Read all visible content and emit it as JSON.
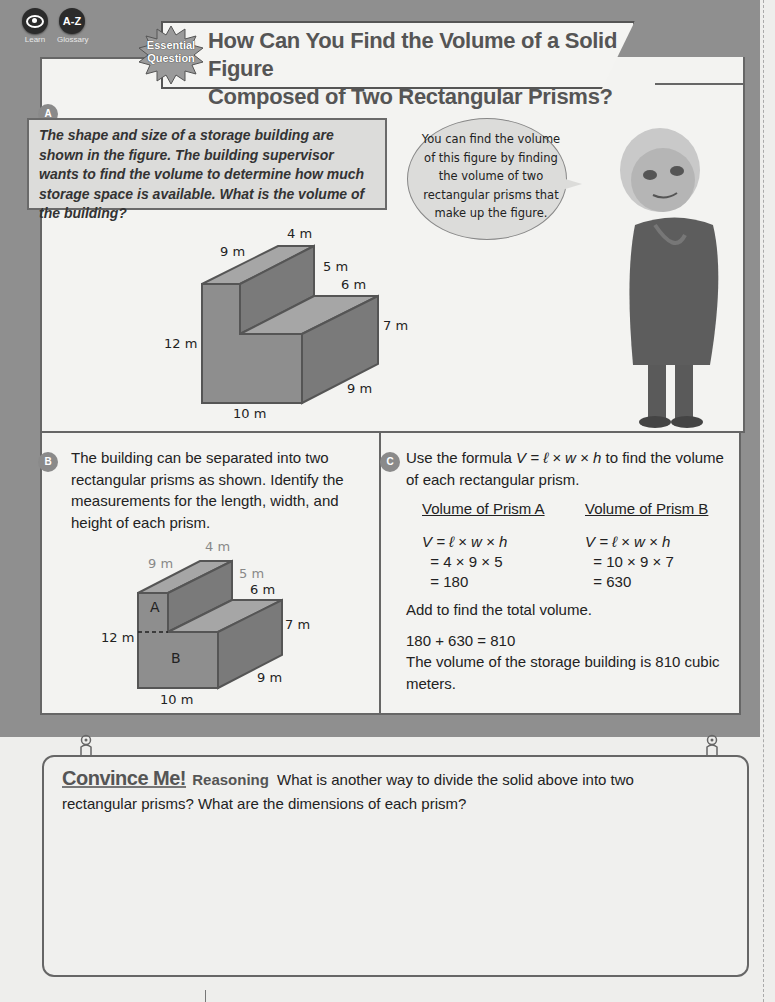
{
  "header": {
    "icons": [
      {
        "name": "learn",
        "label": "Learn",
        "icon": "eye-icon"
      },
      {
        "name": "glossary",
        "label": "Glossary",
        "icon": "A-Z"
      }
    ],
    "badge": {
      "line1": "Essential",
      "line2": "Question"
    },
    "title_line1": "How Can You Find the Volume of a Solid Figure",
    "title_line2": "Composed of Two Rectangular Prisms?"
  },
  "section_a": {
    "badge": "A",
    "problem": "The shape and size of a storage building are shown in the figure. The building supervisor wants to find the volume to determine how much storage space is available. What is the volume of the building?",
    "speech": "You can find the volume of this figure by finding the volume of two rectangular prisms that make up the figure.",
    "figure_labels": {
      "top_width": "4 m",
      "top_depth": "9 m",
      "step_height": "5 m",
      "step_width": "6 m",
      "front_height": "12 m",
      "right_height": "7 m",
      "base_depth": "9 m",
      "base_length": "10 m"
    }
  },
  "section_b": {
    "badge": "B",
    "text": "The building can be separated into two rectangular prisms as shown. Identify the measurements for the length, width, and height of each prism.",
    "figure_labels": {
      "top_width": "4 m",
      "top_depth": "9 m",
      "step_height": "5 m",
      "step_width": "6 m",
      "front_height": "12 m",
      "right_height": "7 m",
      "base_depth": "9 m",
      "base_length": "10 m",
      "prism_a": "A",
      "prism_b": "B"
    }
  },
  "section_c": {
    "badge": "C",
    "intro_pre": "Use the formula ",
    "intro_formula": "V = ℓ × w × h",
    "intro_post": " to find the volume of each rectangular prism.",
    "prism_a": {
      "heading": "Volume of Prism A",
      "formula": "V = ℓ × w × h",
      "step1": "  = 4 × 9 × 5",
      "step2": "  = 180"
    },
    "prism_b": {
      "heading": "Volume of Prism B",
      "formula": "V = ℓ × w × h",
      "step1": "  = 10 × 9 × 7",
      "step2": "  = 630"
    },
    "add_text": "Add to find the total volume.",
    "sum": "180 + 630 = 810",
    "conclusion": "The volume of the storage building is 810 cubic meters."
  },
  "convince_me": {
    "title": "Convince Me!",
    "tag": "Reasoning",
    "prompt": "What is another way to divide the solid above into two rectangular prisms? What are the dimensions of each prism?"
  }
}
